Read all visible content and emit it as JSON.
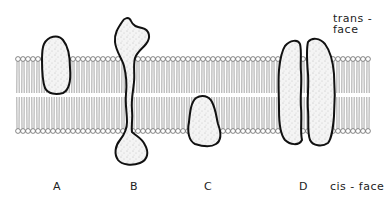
{
  "figure": {
    "type": "lipid bilayer membrane diagram with proteins",
    "face_labels": {
      "top": "trans - face",
      "bottom": "cis - face"
    },
    "proteins": [
      {
        "label": "A",
        "position": "embedded in upper (trans) leaflet"
      },
      {
        "label": "B",
        "position": "transmembrane, domains on both faces"
      },
      {
        "label": "C",
        "position": "embedded in lower (cis) leaflet"
      },
      {
        "label": "D",
        "position": "transmembrane pair (two subunits)"
      }
    ],
    "colors": {
      "outline": "#111111",
      "protein_fill": "#f2f2f2",
      "stipple": "#8a8a8a",
      "lipid": "#555555",
      "background": "#ffffff"
    }
  }
}
